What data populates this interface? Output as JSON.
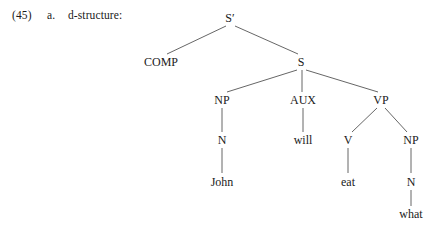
{
  "caption": {
    "number": "(45)",
    "letter": "a.",
    "label": "d-structure:"
  },
  "style": {
    "line_color": "#555555",
    "text_color": "#1a1a1a",
    "background": "#ffffff"
  },
  "tree": {
    "sentence": "John will eat what",
    "root": "S'",
    "nodes": [
      {
        "id": "sbar",
        "label": "S′",
        "x": 230,
        "y": 18,
        "kind": "phrasal"
      },
      {
        "id": "comp",
        "label": "COMP",
        "x": 161,
        "y": 62,
        "kind": "phrasal"
      },
      {
        "id": "s",
        "label": "S",
        "x": 301,
        "y": 62,
        "kind": "phrasal"
      },
      {
        "id": "np1",
        "label": "NP",
        "x": 222,
        "y": 100,
        "kind": "phrasal"
      },
      {
        "id": "aux",
        "label": "AUX",
        "x": 303,
        "y": 100,
        "kind": "phrasal"
      },
      {
        "id": "vp",
        "label": "VP",
        "x": 381,
        "y": 100,
        "kind": "phrasal"
      },
      {
        "id": "n1",
        "label": "N",
        "x": 222,
        "y": 140,
        "kind": "lexical"
      },
      {
        "id": "will",
        "label": "will",
        "x": 303,
        "y": 140,
        "kind": "terminal"
      },
      {
        "id": "v",
        "label": "V",
        "x": 348,
        "y": 140,
        "kind": "lexical"
      },
      {
        "id": "np2",
        "label": "NP",
        "x": 411,
        "y": 140,
        "kind": "phrasal"
      },
      {
        "id": "john",
        "label": "John",
        "x": 222,
        "y": 182,
        "kind": "terminal"
      },
      {
        "id": "eat",
        "label": "eat",
        "x": 348,
        "y": 182,
        "kind": "terminal"
      },
      {
        "id": "n2",
        "label": "N",
        "x": 411,
        "y": 182,
        "kind": "lexical"
      },
      {
        "id": "what",
        "label": "what",
        "x": 411,
        "y": 214,
        "kind": "terminal"
      }
    ],
    "edges": [
      {
        "from": "sbar",
        "to": "comp",
        "x1": 226,
        "y1": 26,
        "x2": 167,
        "y2": 54
      },
      {
        "from": "sbar",
        "to": "s",
        "x1": 235,
        "y1": 26,
        "x2": 298,
        "y2": 54
      },
      {
        "from": "s",
        "to": "np1",
        "x1": 297,
        "y1": 70,
        "x2": 227,
        "y2": 92
      },
      {
        "from": "s",
        "to": "aux",
        "x1": 302,
        "y1": 70,
        "x2": 302,
        "y2": 92
      },
      {
        "from": "s",
        "to": "vp",
        "x1": 306,
        "y1": 70,
        "x2": 378,
        "y2": 92
      },
      {
        "from": "np1",
        "to": "n1",
        "x1": 222,
        "y1": 108,
        "x2": 222,
        "y2": 132
      },
      {
        "from": "aux",
        "to": "will",
        "x1": 303,
        "y1": 108,
        "x2": 303,
        "y2": 132
      },
      {
        "from": "vp",
        "to": "v",
        "x1": 377,
        "y1": 108,
        "x2": 352,
        "y2": 132
      },
      {
        "from": "vp",
        "to": "np2",
        "x1": 385,
        "y1": 108,
        "x2": 407,
        "y2": 132
      },
      {
        "from": "n1",
        "to": "john",
        "x1": 222,
        "y1": 148,
        "x2": 222,
        "y2": 173
      },
      {
        "from": "v",
        "to": "eat",
        "x1": 348,
        "y1": 148,
        "x2": 348,
        "y2": 173
      },
      {
        "from": "np2",
        "to": "n2",
        "x1": 411,
        "y1": 148,
        "x2": 411,
        "y2": 173
      },
      {
        "from": "n2",
        "to": "what",
        "x1": 411,
        "y1": 190,
        "x2": 411,
        "y2": 206
      }
    ]
  }
}
